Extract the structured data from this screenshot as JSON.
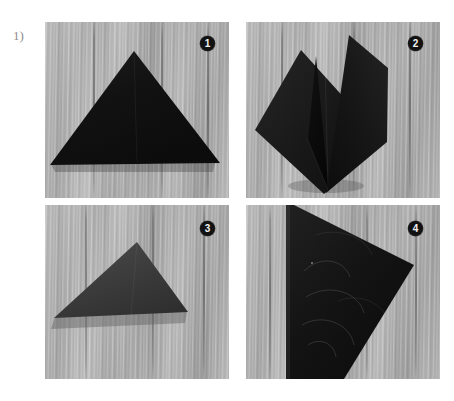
{
  "figure": {
    "step_label": "1)",
    "label_color": "#8e8e8e",
    "background_color": "#ffffff",
    "panel_count": 4,
    "layout": "2x2 photo grid"
  },
  "palette": {
    "wood_light": "#c2c2c2",
    "wood_mid": "#aeaeae",
    "wood_dark": "#a3a3a3",
    "paper_black": "#131313",
    "paper_black_soft": "#3a3a3a",
    "badge_fill": "#121212",
    "badge_text": "#f2f2f2",
    "page_white": "#ffffff"
  },
  "panels": [
    {
      "badge": "1",
      "name": "panel-1",
      "subject": "black paper folded into a wide triangle lying flat on grey wood planks",
      "shape": "triangle",
      "shade": "#131313"
    },
    {
      "badge": "2",
      "name": "panel-2",
      "subject": "black paper opened into two raised wing flaps with a deep centre valley fold",
      "shape": "two-winged fold",
      "shade": "#191919"
    },
    {
      "badge": "3",
      "name": "panel-3",
      "subject": "black paper folded into a lower wide triangle, slightly tilted, casting a soft shadow",
      "shape": "triangle",
      "shade": "#3b3b3b"
    },
    {
      "badge": "4",
      "name": "panel-4",
      "subject": "large black folded sheet filling most of the frame, angled corner pointing right, with faint round creases",
      "shape": "large angled polygon",
      "shade": "#161616"
    }
  ]
}
